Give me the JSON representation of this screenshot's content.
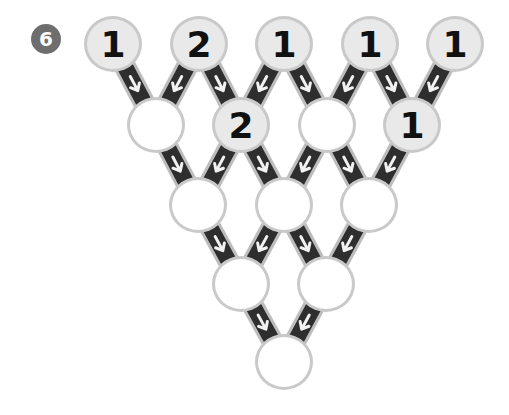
{
  "puzzle": {
    "number_label": "6",
    "rows": [
      {
        "y": 44,
        "nodes": [
          {
            "x": 113,
            "value": "1",
            "filled": true
          },
          {
            "x": 199,
            "value": "2",
            "filled": true
          },
          {
            "x": 284,
            "value": "1",
            "filled": true
          },
          {
            "x": 370,
            "value": "1",
            "filled": true
          },
          {
            "x": 455,
            "value": "1",
            "filled": true
          }
        ]
      },
      {
        "y": 125,
        "nodes": [
          {
            "x": 156,
            "value": "",
            "filled": false
          },
          {
            "x": 241,
            "value": "2",
            "filled": true
          },
          {
            "x": 327,
            "value": "",
            "filled": false
          },
          {
            "x": 412,
            "value": "1",
            "filled": true
          }
        ]
      },
      {
        "y": 205,
        "nodes": [
          {
            "x": 198,
            "value": "",
            "filled": false
          },
          {
            "x": 284,
            "value": "",
            "filled": false
          },
          {
            "x": 369,
            "value": "",
            "filled": false
          }
        ]
      },
      {
        "y": 284,
        "nodes": [
          {
            "x": 241,
            "value": "",
            "filled": false
          },
          {
            "x": 326,
            "value": "",
            "filled": false
          }
        ]
      },
      {
        "y": 362,
        "nodes": [
          {
            "x": 284,
            "value": "",
            "filled": false
          }
        ]
      }
    ],
    "colors": {
      "connector_fill": "#2e2e2e",
      "connector_border": "#bdbdbd",
      "arrow": "#f2f2f2",
      "badge": "#6e6e6e",
      "node_border": "#c9c9c9",
      "node_filled": "#e9e9e9",
      "node_empty": "#ffffff"
    }
  }
}
